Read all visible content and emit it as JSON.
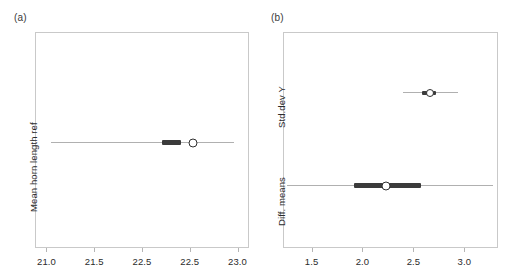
{
  "figure": {
    "background": "#ffffff",
    "line_color": "#3b3b3b",
    "thin_color": "#b0b0b0",
    "frame_color": "#c9c9c9"
  },
  "chart_data": [
    {
      "type": "scatter",
      "panel": "a",
      "panel_label": "(a)",
      "title": "",
      "xlabel": "",
      "ylabel": "Mean horn length ref",
      "xlim": [
        20.88,
        23.12
      ],
      "xticks": [
        21.0,
        21.5,
        22.0,
        22.5,
        23.0
      ],
      "xticklabels": [
        "21.0",
        "21.5",
        "22.5",
        "22.5",
        "23.0"
      ],
      "grid": false,
      "legend": "none",
      "orientation": "horizontal-interval",
      "rows": [
        {
          "label": "Mean horn length ref",
          "estimate": 22.53,
          "inner_low": 22.21,
          "inner_high": 22.41,
          "outer_low": 21.05,
          "outer_high": 22.96
        }
      ]
    },
    {
      "type": "scatter",
      "panel": "b",
      "panel_label": "(b)",
      "title": "",
      "xlabel": "",
      "ylabel": "",
      "xlim": [
        1.22,
        3.33
      ],
      "xticks": [
        1.5,
        2.0,
        2.5,
        3.0
      ],
      "xticklabels": [
        "1.5",
        "2.0",
        "2.5",
        "3.0"
      ],
      "grid": false,
      "legend": "none",
      "orientation": "horizontal-interval",
      "rows": [
        {
          "label": "Std.dev Y",
          "estimate": 2.66,
          "inner_low": 2.58,
          "inner_high": 2.72,
          "outer_low": 2.4,
          "outer_high": 2.94
        },
        {
          "label": "Diff. means",
          "estimate": 2.23,
          "inner_low": 1.92,
          "inner_high": 2.57,
          "outer_low": 1.26,
          "outer_high": 3.28
        }
      ]
    }
  ]
}
